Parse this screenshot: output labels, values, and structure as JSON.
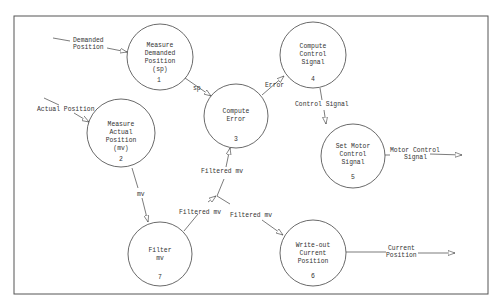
{
  "diagram": {
    "type": "data-flow-diagram",
    "processes": [
      {
        "id": "1",
        "lines": [
          "Measure",
          "Demanded",
          "Position",
          "(sp)"
        ],
        "number": "1"
      },
      {
        "id": "2",
        "lines": [
          "Measure",
          "Actual",
          "Position",
          "(mv)"
        ],
        "number": "2"
      },
      {
        "id": "3",
        "lines": [
          "Compute",
          "Error"
        ],
        "number": "3"
      },
      {
        "id": "4",
        "lines": [
          "Compute",
          "Control",
          "Signal"
        ],
        "number": "4"
      },
      {
        "id": "5",
        "lines": [
          "Set Motor",
          "Control",
          "Signal"
        ],
        "number": "5"
      },
      {
        "id": "6",
        "lines": [
          "Write-out",
          "Current",
          "Position"
        ],
        "number": "6"
      },
      {
        "id": "7",
        "lines": [
          "Filter",
          "mv"
        ],
        "number": "7"
      }
    ],
    "flows": [
      {
        "label_lines": [
          "Demanded",
          "Position"
        ],
        "from": "external",
        "to": "1"
      },
      {
        "label_lines": [
          "Actual Position"
        ],
        "from": "external",
        "to": "2"
      },
      {
        "label_lines": [
          "sp"
        ],
        "from": "1",
        "to": "3"
      },
      {
        "label_lines": [
          "Error"
        ],
        "from": "3",
        "to": "4"
      },
      {
        "label_lines": [
          "Control Signal"
        ],
        "from": "4",
        "to": "5"
      },
      {
        "label_lines": [
          "Motor Control",
          "Signal"
        ],
        "from": "5",
        "to": "external"
      },
      {
        "label_lines": [
          "mv"
        ],
        "from": "2",
        "to": "7"
      },
      {
        "label_lines": [
          "Filtered mv"
        ],
        "from": "7",
        "to": "junction"
      },
      {
        "label_lines": [
          "Filtered mv"
        ],
        "from": "junction",
        "to": "3"
      },
      {
        "label_lines": [
          "Filtered mv"
        ],
        "from": "junction",
        "to": "6"
      },
      {
        "label_lines": [
          "Current",
          "Position"
        ],
        "from": "6",
        "to": "external"
      }
    ]
  }
}
